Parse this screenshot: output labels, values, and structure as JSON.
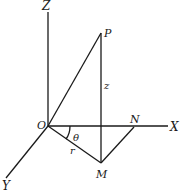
{
  "diagram": {
    "type": "3d-coordinate-cylindrical",
    "axes": [
      {
        "name": "Z",
        "label": "Z"
      },
      {
        "name": "X",
        "label": "X"
      },
      {
        "name": "Y",
        "label": "Y"
      }
    ],
    "points": {
      "origin": "O",
      "p": "P",
      "m": "M",
      "n": "N"
    },
    "annotations": {
      "height": "z",
      "radius": "r",
      "angle": "θ"
    }
  }
}
